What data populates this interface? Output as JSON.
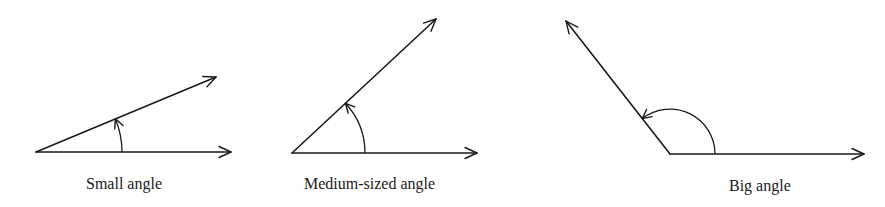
{
  "diagram": {
    "type": "angle-comparison",
    "stroke_color": "#1a1a1a",
    "background": "#ffffff",
    "panels": [
      {
        "id": "small",
        "caption": "Small angle",
        "vertex": [
          36,
          152
        ],
        "base_tip": [
          231,
          152
        ],
        "ray_tip": [
          216,
          77
        ],
        "arc_radius": 86,
        "angle_deg": 22.6,
        "caption_pos": [
          86,
          189
        ]
      },
      {
        "id": "medium",
        "caption": "Medium-sized angle",
        "vertex": [
          292,
          153
        ],
        "base_tip": [
          477,
          153
        ],
        "ray_tip": [
          436,
          19
        ],
        "arc_radius": 73,
        "angle_deg": 42.9,
        "caption_pos": [
          304,
          189
        ]
      },
      {
        "id": "big",
        "caption": "Big angle",
        "vertex": [
          670,
          154
        ],
        "base_tip": [
          864,
          154
        ],
        "ray_tip": [
          566,
          21
        ],
        "arc_radius": 45,
        "angle_deg": 128,
        "caption_pos": [
          729,
          191
        ]
      }
    ]
  }
}
